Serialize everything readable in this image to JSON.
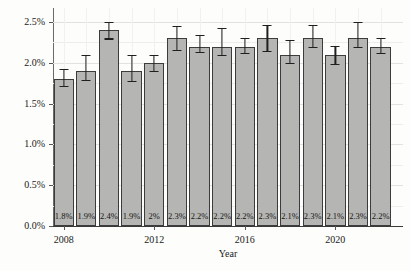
{
  "chart_data": {
    "type": "bar",
    "title": "",
    "xlabel": "Year",
    "ylabel": "",
    "x": [
      2008,
      2009,
      2010,
      2011,
      2012,
      2013,
      2014,
      2015,
      2016,
      2017,
      2018,
      2019,
      2020,
      2021,
      2022
    ],
    "values": [
      1.8,
      1.9,
      2.4,
      1.9,
      2.0,
      2.3,
      2.2,
      2.2,
      2.2,
      2.3,
      2.1,
      2.3,
      2.1,
      2.3,
      2.2
    ],
    "bar_labels": [
      "1.8%",
      "1.9%",
      "2.4%",
      "1.9%",
      "2%",
      "2.3%",
      "2.2%",
      "2.2%",
      "2.2%",
      "2.3%",
      "2.1%",
      "2.3%",
      "2.1%",
      "2.3%",
      "2.2%"
    ],
    "error_low": [
      1.72,
      1.79,
      2.3,
      1.78,
      1.9,
      2.16,
      2.13,
      2.1,
      2.12,
      2.15,
      2.0,
      2.2,
      1.99,
      2.2,
      2.12
    ],
    "error_high": [
      1.93,
      2.1,
      2.5,
      2.1,
      2.1,
      2.45,
      2.34,
      2.43,
      2.31,
      2.47,
      2.28,
      2.47,
      2.21,
      2.5,
      2.31
    ],
    "x_tick_labels": [
      "2008",
      "2012",
      "2016",
      "2020"
    ],
    "x_tick_indices": [
      0,
      4,
      8,
      12
    ],
    "y_tick_labels": [
      "0.0%",
      "0.5%",
      "1.0%",
      "1.5%",
      "2.0%",
      "2.5%"
    ],
    "y_tick_values": [
      0,
      0.5,
      1.0,
      1.5,
      2.0,
      2.5
    ],
    "ylim": [
      0,
      2.673
    ],
    "grid": "on",
    "legend": "none",
    "bar_color": "#b5b5b3",
    "bar_border_color": "#3c3c3c",
    "error_bar_color": "#1f1f1f",
    "background_color": "#fdfdfb"
  }
}
